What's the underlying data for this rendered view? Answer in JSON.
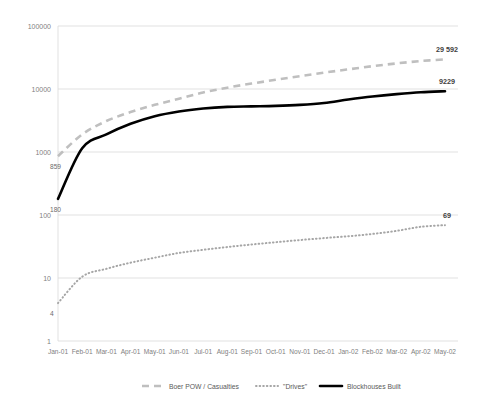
{
  "chart_data": {
    "type": "line",
    "title": "",
    "subtitle": "",
    "xlabel": "",
    "ylabel": "",
    "yscale": "log",
    "ylim": [
      1,
      100000
    ],
    "y_ticks": [
      "1",
      "10",
      "100",
      "1000",
      "10000",
      "100000"
    ],
    "y_tick_values": [
      1,
      10,
      100,
      1000,
      10000,
      100000
    ],
    "grid": true,
    "legend_position": "bottom",
    "categories": [
      "Jan-01",
      "Feb-01",
      "Mar-01",
      "Apr-01",
      "May-01",
      "Jun-01",
      "Jul-01",
      "Aug-01",
      "Sep-01",
      "Oct-01",
      "Nov-01",
      "Dec-01",
      "Jan-02",
      "Feb-02",
      "Mar-02",
      "Apr-02",
      "May-02"
    ],
    "series": [
      {
        "name": "Boer POW / Casualties",
        "style": "dashed",
        "color": "#bfbfbf",
        "values": [
          859,
          1900,
          3100,
          4300,
          5600,
          7000,
          8800,
          10500,
          12200,
          14000,
          16000,
          18200,
          20500,
          23000,
          25500,
          27800,
          29592
        ],
        "end_label": "29 592",
        "start_label": "859"
      },
      {
        "name": "\"Drives\"",
        "style": "dotted",
        "color": "#a6a6a6",
        "values": [
          4,
          10.5,
          14,
          17.5,
          21,
          25,
          28,
          31,
          34,
          37,
          40,
          43,
          46,
          50,
          56,
          65,
          69
        ],
        "end_label": "69",
        "start_label": "4"
      },
      {
        "name": "Blockhouses Built",
        "style": "solid",
        "color": "#000000",
        "values": [
          180,
          1150,
          1900,
          2800,
          3700,
          4400,
          4900,
          5200,
          5300,
          5400,
          5600,
          6000,
          6800,
          7600,
          8300,
          8900,
          9229
        ],
        "end_label": "9229",
        "start_label": "180"
      }
    ],
    "annotations": [
      {
        "text": "29 592",
        "series": "Boer POW / Casualties",
        "position": "end-top"
      },
      {
        "text": "9229",
        "series": "Blockhouses Built",
        "position": "end-top"
      },
      {
        "text": "69",
        "series": "\"Drives\"",
        "position": "end-top"
      },
      {
        "text": "859",
        "series": "Boer POW / Casualties",
        "position": "start-below"
      },
      {
        "text": "180",
        "series": "Blockhouses Built",
        "position": "start-below"
      },
      {
        "text": "4",
        "series": "\"Drives\"",
        "position": "start-below"
      }
    ]
  },
  "legend": {
    "items": [
      {
        "label": "Boer POW / Casualties",
        "marker": "dashed-line-marker",
        "color": "#bfbfbf"
      },
      {
        "label": "\"Drives\"",
        "marker": "dotted-line-marker",
        "color": "#a6a6a6"
      },
      {
        "label": "Blockhouses Built",
        "marker": "solid-line-marker",
        "color": "#000000"
      }
    ]
  },
  "colors": {
    "gridline": "#d9d9d9",
    "tick_text": "#7f7f7f",
    "label_text": "#404040",
    "background": "#ffffff"
  }
}
